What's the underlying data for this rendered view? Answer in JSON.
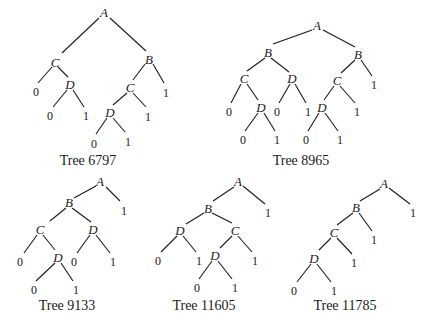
{
  "figure": {
    "trees": [
      {
        "id": "tree-6797",
        "caption": "Tree 6797",
        "caption_pos": [
          88,
          165
        ],
        "nodes": [
          {
            "k": "n0",
            "label": "A",
            "type": "node",
            "x": 104,
            "y": 14
          },
          {
            "k": "n1",
            "label": "C",
            "type": "node",
            "x": 55,
            "y": 64
          },
          {
            "k": "n2",
            "label": "B",
            "type": "node",
            "x": 149,
            "y": 61
          },
          {
            "k": "n3",
            "label": "0",
            "type": "leaf",
            "x": 36,
            "y": 93
          },
          {
            "k": "n4",
            "label": "D",
            "type": "node",
            "x": 70,
            "y": 86
          },
          {
            "k": "n5",
            "label": "0",
            "type": "leaf",
            "x": 50,
            "y": 117
          },
          {
            "k": "n6",
            "label": "1",
            "type": "leaf",
            "x": 86,
            "y": 117
          },
          {
            "k": "n7",
            "label": "C",
            "type": "node",
            "x": 130,
            "y": 89
          },
          {
            "k": "n8",
            "label": "1",
            "type": "leaf",
            "x": 166,
            "y": 94
          },
          {
            "k": "n9",
            "label": "D",
            "type": "node",
            "x": 110,
            "y": 114
          },
          {
            "k": "n10",
            "label": "1",
            "type": "leaf",
            "x": 148,
            "y": 118
          },
          {
            "k": "n11",
            "label": "0",
            "type": "leaf",
            "x": 94,
            "y": 145
          },
          {
            "k": "n12",
            "label": "1",
            "type": "leaf",
            "x": 128,
            "y": 143
          }
        ],
        "edges": [
          [
            99,
            18,
            62,
            53
          ],
          [
            110,
            18,
            146,
            51
          ],
          [
            52,
            67,
            38,
            83
          ],
          [
            58,
            67,
            68,
            77
          ],
          [
            145,
            64,
            133,
            80
          ],
          [
            153,
            64,
            164,
            83
          ],
          [
            67,
            90,
            53,
            107
          ],
          [
            73,
            90,
            84,
            107
          ],
          [
            127,
            93,
            113,
            105
          ],
          [
            133,
            93,
            146,
            107
          ],
          [
            107,
            118,
            96,
            134
          ],
          [
            113,
            118,
            125,
            132
          ]
        ]
      },
      {
        "id": "tree-8965",
        "caption": "Tree 8965",
        "caption_pos": [
          301,
          165
        ],
        "nodes": [
          {
            "k": "n0",
            "label": "A",
            "type": "node",
            "x": 317,
            "y": 27
          },
          {
            "k": "n1",
            "label": "B",
            "type": "node",
            "x": 268,
            "y": 54
          },
          {
            "k": "n2",
            "label": "B",
            "type": "node",
            "x": 358,
            "y": 56
          },
          {
            "k": "n3",
            "label": "C",
            "type": "node",
            "x": 244,
            "y": 80
          },
          {
            "k": "n4",
            "label": "D",
            "type": "node",
            "x": 292,
            "y": 80
          },
          {
            "k": "n5",
            "label": "C",
            "type": "node",
            "x": 337,
            "y": 82
          },
          {
            "k": "n6",
            "label": "1",
            "type": "leaf",
            "x": 374,
            "y": 86
          },
          {
            "k": "n7",
            "label": "0",
            "type": "leaf",
            "x": 229,
            "y": 113
          },
          {
            "k": "n8",
            "label": "D",
            "type": "node",
            "x": 261,
            "y": 109
          },
          {
            "k": "n9",
            "label": "0",
            "type": "leaf",
            "x": 277,
            "y": 113
          },
          {
            "k": "n10",
            "label": "1",
            "type": "leaf",
            "x": 308,
            "y": 113
          },
          {
            "k": "n11",
            "label": "D",
            "type": "node",
            "x": 322,
            "y": 109
          },
          {
            "k": "n12",
            "label": "1",
            "type": "leaf",
            "x": 357,
            "y": 113
          },
          {
            "k": "n13",
            "label": "0",
            "type": "leaf",
            "x": 243,
            "y": 141
          },
          {
            "k": "n14",
            "label": "1",
            "type": "leaf",
            "x": 277,
            "y": 141
          },
          {
            "k": "n15",
            "label": "0",
            "type": "leaf",
            "x": 306,
            "y": 141
          },
          {
            "k": "n16",
            "label": "1",
            "type": "leaf",
            "x": 340,
            "y": 141
          }
        ],
        "edges": [
          [
            312,
            30,
            273,
            44
          ],
          [
            323,
            30,
            355,
            47
          ],
          [
            265,
            58,
            247,
            71
          ],
          [
            271,
            58,
            289,
            72
          ],
          [
            355,
            60,
            341,
            73
          ],
          [
            361,
            60,
            372,
            76
          ],
          [
            241,
            84,
            231,
            103
          ],
          [
            247,
            84,
            258,
            100
          ],
          [
            290,
            84,
            279,
            103
          ],
          [
            295,
            84,
            306,
            103
          ],
          [
            334,
            86,
            324,
            100
          ],
          [
            340,
            86,
            355,
            103
          ],
          [
            258,
            113,
            245,
            131
          ],
          [
            264,
            113,
            275,
            131
          ],
          [
            319,
            113,
            308,
            131
          ],
          [
            325,
            113,
            338,
            131
          ]
        ]
      },
      {
        "id": "tree-9133",
        "caption": "Tree 9133",
        "caption_pos": [
          67,
          310
        ],
        "nodes": [
          {
            "k": "n0",
            "label": "A",
            "type": "node",
            "x": 100,
            "y": 183
          },
          {
            "k": "n1",
            "label": "1",
            "type": "leaf",
            "x": 124,
            "y": 212
          },
          {
            "k": "n2",
            "label": "B",
            "type": "node",
            "x": 69,
            "y": 204
          },
          {
            "k": "n3",
            "label": "C",
            "type": "node",
            "x": 40,
            "y": 231
          },
          {
            "k": "n4",
            "label": "D",
            "type": "node",
            "x": 93,
            "y": 231
          },
          {
            "k": "n5",
            "label": "0",
            "type": "leaf",
            "x": 20,
            "y": 263
          },
          {
            "k": "n6",
            "label": "D",
            "type": "node",
            "x": 58,
            "y": 259
          },
          {
            "k": "n7",
            "label": "0",
            "type": "leaf",
            "x": 74,
            "y": 263
          },
          {
            "k": "n8",
            "label": "1",
            "type": "leaf",
            "x": 113,
            "y": 263
          },
          {
            "k": "n9",
            "label": "0",
            "type": "leaf",
            "x": 34,
            "y": 291
          },
          {
            "k": "n10",
            "label": "1",
            "type": "leaf",
            "x": 76,
            "y": 291
          }
        ],
        "edges": [
          [
            96,
            186,
            74,
            198
          ],
          [
            106,
            187,
            120,
            201
          ],
          [
            66,
            208,
            50,
            221
          ],
          [
            72,
            208,
            91,
            222
          ],
          [
            37,
            235,
            24,
            253
          ],
          [
            43,
            235,
            55,
            250
          ],
          [
            90,
            235,
            77,
            253
          ],
          [
            96,
            235,
            110,
            253
          ],
          [
            55,
            263,
            36,
            281
          ],
          [
            61,
            263,
            73,
            281
          ]
        ]
      },
      {
        "id": "tree-11605",
        "caption": "Tree 11605",
        "caption_pos": [
          204,
          310
        ],
        "nodes": [
          {
            "k": "n0",
            "label": "A",
            "type": "node",
            "x": 238,
            "y": 183
          },
          {
            "k": "n1",
            "label": "1",
            "type": "leaf",
            "x": 268,
            "y": 214
          },
          {
            "k": "n2",
            "label": "B",
            "type": "node",
            "x": 208,
            "y": 210
          },
          {
            "k": "n3",
            "label": "D",
            "type": "node",
            "x": 180,
            "y": 232
          },
          {
            "k": "n4",
            "label": "C",
            "type": "node",
            "x": 235,
            "y": 232
          },
          {
            "k": "n5",
            "label": "0",
            "type": "leaf",
            "x": 158,
            "y": 262
          },
          {
            "k": "n6",
            "label": "1",
            "type": "leaf",
            "x": 199,
            "y": 262
          },
          {
            "k": "n7",
            "label": "D",
            "type": "node",
            "x": 215,
            "y": 257
          },
          {
            "k": "n8",
            "label": "1",
            "type": "leaf",
            "x": 255,
            "y": 262
          },
          {
            "k": "n9",
            "label": "0",
            "type": "leaf",
            "x": 197,
            "y": 289
          },
          {
            "k": "n10",
            "label": "1",
            "type": "leaf",
            "x": 235,
            "y": 289
          }
        ],
        "edges": [
          [
            234,
            187,
            213,
            201
          ],
          [
            243,
            186,
            265,
            204
          ],
          [
            204,
            213,
            186,
            224
          ],
          [
            212,
            213,
            232,
            223
          ],
          [
            177,
            236,
            161,
            252
          ],
          [
            183,
            236,
            196,
            252
          ],
          [
            232,
            236,
            220,
            248
          ],
          [
            238,
            236,
            252,
            252
          ],
          [
            212,
            261,
            199,
            279
          ],
          [
            218,
            261,
            232,
            279
          ]
        ]
      },
      {
        "id": "tree-11785",
        "caption": "Tree 11785",
        "caption_pos": [
          345,
          310
        ],
        "nodes": [
          {
            "k": "n0",
            "label": "A",
            "type": "node",
            "x": 384,
            "y": 185
          },
          {
            "k": "n1",
            "label": "1",
            "type": "leaf",
            "x": 413,
            "y": 214
          },
          {
            "k": "n2",
            "label": "B",
            "type": "node",
            "x": 356,
            "y": 209
          },
          {
            "k": "n3",
            "label": "C",
            "type": "node",
            "x": 334,
            "y": 234
          },
          {
            "k": "n4",
            "label": "1",
            "type": "leaf",
            "x": 374,
            "y": 241
          },
          {
            "k": "n5",
            "label": "D",
            "type": "node",
            "x": 314,
            "y": 260
          },
          {
            "k": "n6",
            "label": "1",
            "type": "leaf",
            "x": 354,
            "y": 264
          },
          {
            "k": "n7",
            "label": "0",
            "type": "leaf",
            "x": 294,
            "y": 292
          },
          {
            "k": "n8",
            "label": "1",
            "type": "leaf",
            "x": 334,
            "y": 292
          }
        ],
        "edges": [
          [
            380,
            189,
            360,
            201
          ],
          [
            389,
            188,
            410,
            204
          ],
          [
            353,
            213,
            337,
            225
          ],
          [
            359,
            213,
            372,
            231
          ],
          [
            331,
            238,
            319,
            250
          ],
          [
            337,
            238,
            352,
            254
          ],
          [
            311,
            264,
            297,
            282
          ],
          [
            317,
            264,
            331,
            282
          ]
        ]
      }
    ]
  }
}
